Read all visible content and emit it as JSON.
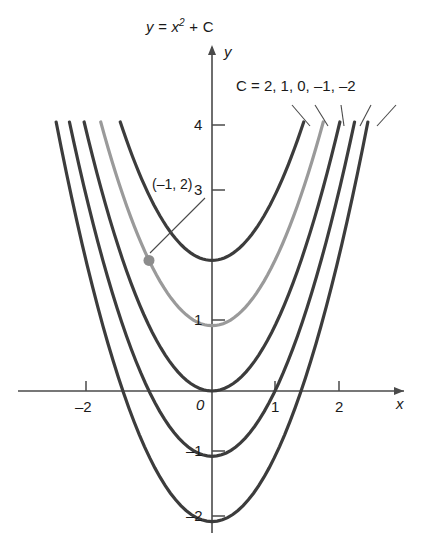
{
  "figure": {
    "title": "y = x",
    "title_exponent": "2",
    "title_tail": " + C",
    "axis_x_label": "x",
    "axis_y_label": "y",
    "origin_label": "0",
    "family_label_prefix": "C = ",
    "family_label": "C = 2, 1,  0, –1, –2",
    "point_label": "(–1, 2)",
    "colors": {
      "curve_dark": "#3c3c3c",
      "curve_highlight": "#9a9a9a",
      "axis": "#4a4a4a",
      "text": "#1a1a1a",
      "marker": "#8c8c8c",
      "background": "#ffffff"
    }
  },
  "chart_data": {
    "type": "line",
    "xlabel": "x",
    "ylabel": "y",
    "xlim": [
      -2.6,
      2.6
    ],
    "ylim": [
      -2.4,
      4.6
    ],
    "grid": false,
    "x_ticks": [
      -2,
      1,
      2
    ],
    "x_tick_labels": [
      "–2",
      "1",
      "2"
    ],
    "y_ticks": [
      4,
      3,
      1,
      -1,
      -2
    ],
    "y_tick_labels": [
      "4",
      "3",
      "1",
      "–1",
      "–2"
    ],
    "origin_tick_label": "0",
    "legend_position": "top-right",
    "legend_text": "C = 2, 1,  0, –1, –2",
    "series": [
      {
        "name": "C = 2",
        "C": 2,
        "equation": "y = x² + 2",
        "vertex": [
          0,
          2
        ],
        "color": "#3c3c3c",
        "highlight": false
      },
      {
        "name": "C = 1",
        "C": 1,
        "equation": "y = x² + 1",
        "vertex": [
          0,
          1
        ],
        "color": "#9a9a9a",
        "highlight": true
      },
      {
        "name": "C = 0",
        "C": 0,
        "equation": "y = x²",
        "vertex": [
          0,
          0
        ],
        "color": "#3c3c3c",
        "highlight": false
      },
      {
        "name": "C = –1",
        "C": -1,
        "equation": "y = x² – 1",
        "vertex": [
          0,
          -1
        ],
        "color": "#3c3c3c",
        "highlight": false
      },
      {
        "name": "C = –2",
        "C": -2,
        "equation": "y = x² – 2",
        "vertex": [
          0,
          -2
        ],
        "color": "#3c3c3c",
        "highlight": false
      }
    ],
    "annotations": [
      {
        "label": "(–1, 2)",
        "x": -1,
        "y": 2,
        "on_series": "C = 1",
        "marker": "dot"
      }
    ]
  }
}
